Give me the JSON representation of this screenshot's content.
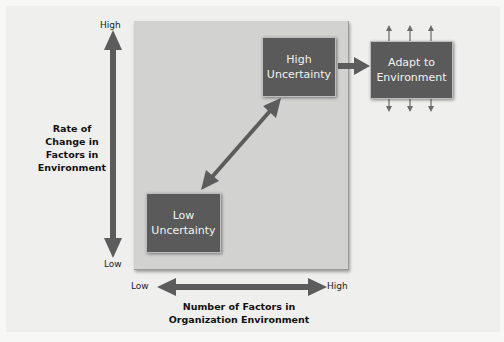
{
  "diagram": {
    "type": "environmental-uncertainty-framework",
    "y_axis": {
      "title_lines": [
        "Rate of",
        "Change in",
        "Factors in",
        "Environment"
      ],
      "high_label": "High",
      "low_label": "Low"
    },
    "x_axis": {
      "title_lines": [
        "Number of Factors in",
        "Organization Environment"
      ],
      "low_label": "Low",
      "high_label": "High"
    },
    "nodes": {
      "high_uncertainty": {
        "lines": [
          "High",
          "Uncertainty"
        ]
      },
      "low_uncertainty": {
        "lines": [
          "Low",
          "Uncertainty"
        ]
      },
      "adapt": {
        "lines": [
          "Adapt to",
          "Environment"
        ]
      }
    },
    "colors": {
      "box_fill": "#5a5a5a",
      "arrow": "#5c5c5c",
      "panel": "#d2d2d1",
      "background": "#efefee"
    }
  }
}
